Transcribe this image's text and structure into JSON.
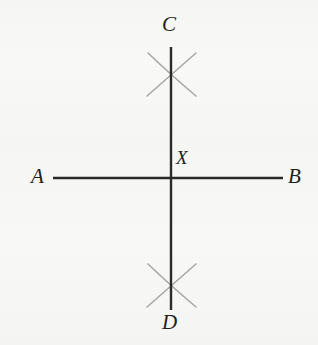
{
  "figure": {
    "background_color": "#f7f7f5",
    "line_color": "#2a2a2a",
    "arc_color": "#a8a8a8",
    "label_color": "#1f1f20",
    "labels": {
      "a": "A",
      "b": "B",
      "c": "C",
      "d": "D",
      "x": "X"
    },
    "segments": [
      {
        "name": "line-ab",
        "from": "A",
        "to": "B",
        "orientation": "horizontal",
        "x1": 53,
        "y1": 178,
        "x2": 283,
        "y2": 178
      },
      {
        "name": "line-cd",
        "from": "C",
        "to": "D",
        "orientation": "vertical",
        "x1": 171,
        "y1": 47,
        "x2": 171,
        "y2": 310
      }
    ],
    "intersection": {
      "name": "X",
      "x": 171,
      "y": 178
    },
    "arc_marks": [
      {
        "name": "upper-arc-pair",
        "crossing_x": 171,
        "crossing_y": 73
      },
      {
        "name": "lower-arc-pair",
        "crossing_x": 171,
        "crossing_y": 285
      }
    ]
  }
}
